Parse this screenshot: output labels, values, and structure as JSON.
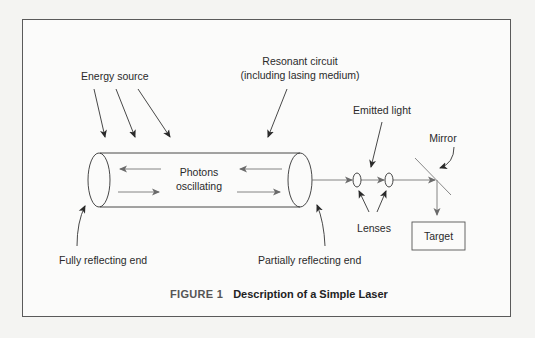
{
  "figure": {
    "caption_number": "FIGURE 1",
    "caption_title": "Description of a Simple Laser"
  },
  "labels": {
    "energy_source": "Energy source",
    "resonant_circuit_line1": "Resonant circuit",
    "resonant_circuit_line2": "(including lasing medium)",
    "photons_line1": "Photons",
    "photons_line2": "oscillating",
    "emitted_light": "Emitted light",
    "mirror": "Mirror",
    "lenses": "Lenses",
    "target": "Target",
    "fully_reflecting_end": "Fully reflecting end",
    "partially_reflecting_end": "Partially reflecting end"
  },
  "colors": {
    "line": "#444444",
    "gray_line": "#8a8a8a",
    "frame": "#5a5a5a"
  }
}
